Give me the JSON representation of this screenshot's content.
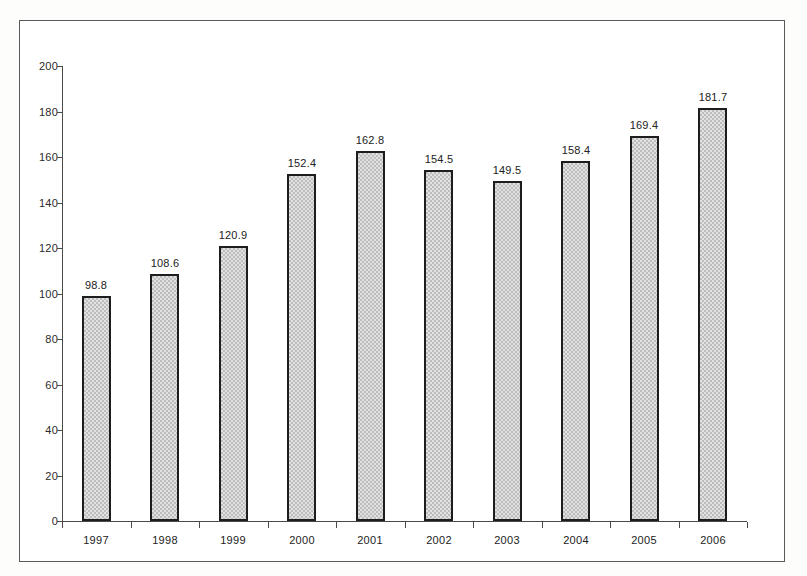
{
  "chart_data": {
    "type": "bar",
    "title": "",
    "subtitle": "",
    "xlabel": "",
    "ylabel": "",
    "categories": [
      "1997",
      "1998",
      "1999",
      "2000",
      "2001",
      "2002",
      "2003",
      "2004",
      "2005",
      "2006"
    ],
    "values": [
      98.8,
      108.6,
      120.9,
      152.4,
      162.8,
      154.5,
      149.5,
      158.4,
      169.4,
      181.7
    ],
    "data_labels": [
      "98.8",
      "108.6",
      "120.9",
      "152.4",
      "162.8",
      "154.5",
      "149.5",
      "158.4",
      "169.4",
      "181.7"
    ],
    "ylim": [
      0,
      200
    ],
    "ytick_step": 20,
    "ytick_labels": [
      "200",
      "180",
      "160",
      "140",
      "120",
      "100",
      "80",
      "60",
      "40",
      "20",
      "0"
    ],
    "ytick_values": [
      200,
      180,
      160,
      140,
      120,
      100,
      80,
      60,
      40,
      20,
      0
    ],
    "grid": false,
    "legend": false,
    "legend_position": "none",
    "bar_fill_color": "#bdbdbd",
    "bar_border_color": "#1d1d1d",
    "axis_color": "#4a4a4a",
    "text_color": "#222222",
    "background_color": "#ffffff",
    "frame_border_color": "#5a5a5a"
  }
}
